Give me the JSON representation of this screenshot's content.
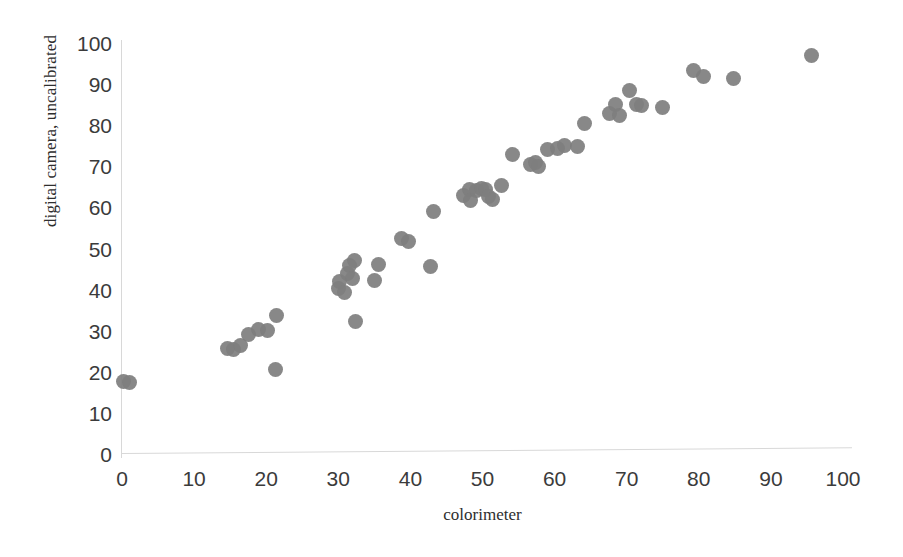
{
  "chart_data": {
    "type": "scatter",
    "title": "",
    "xlabel": "colorimeter",
    "ylabel": "digital camera, uncalibrated",
    "xlim": [
      0,
      100
    ],
    "ylim": [
      0,
      100
    ],
    "xticks": [
      0,
      10,
      20,
      30,
      40,
      50,
      60,
      70,
      80,
      90,
      100
    ],
    "yticks": [
      0,
      10,
      20,
      30,
      40,
      50,
      60,
      70,
      80,
      90,
      100
    ],
    "grid": false,
    "legend": null,
    "marker": {
      "shape": "circle",
      "color": "#7e7e7e",
      "size_px": 15
    },
    "series": [
      {
        "name": "measurements",
        "n_points": 56,
        "points": [
          [
            0.2,
            18.0
          ],
          [
            1.0,
            17.6
          ],
          [
            14.6,
            26.0
          ],
          [
            15.4,
            25.6
          ],
          [
            16.4,
            26.6
          ],
          [
            17.6,
            29.3
          ],
          [
            19.0,
            30.5
          ],
          [
            20.2,
            30.2
          ],
          [
            21.4,
            34.0
          ],
          [
            21.3,
            20.9
          ],
          [
            30.0,
            40.5
          ],
          [
            30.2,
            42.2
          ],
          [
            30.8,
            39.5
          ],
          [
            31.3,
            44.2
          ],
          [
            31.6,
            46.0
          ],
          [
            32.0,
            43.0
          ],
          [
            32.2,
            47.4
          ],
          [
            32.4,
            32.6
          ],
          [
            35.0,
            42.4
          ],
          [
            35.6,
            46.4
          ],
          [
            38.8,
            52.6
          ],
          [
            39.8,
            51.9
          ],
          [
            42.8,
            45.9
          ],
          [
            43.2,
            59.2
          ],
          [
            47.4,
            63.1
          ],
          [
            48.2,
            64.6
          ],
          [
            48.3,
            62.0
          ],
          [
            49.2,
            64.3
          ],
          [
            49.8,
            64.9
          ],
          [
            50.4,
            64.6
          ],
          [
            50.8,
            63.0
          ],
          [
            51.4,
            62.1
          ],
          [
            52.6,
            65.6
          ],
          [
            54.2,
            73.2
          ],
          [
            56.6,
            70.6
          ],
          [
            57.4,
            71.2
          ],
          [
            57.8,
            70.2
          ],
          [
            59.0,
            74.4
          ],
          [
            60.4,
            74.6
          ],
          [
            61.4,
            75.2
          ],
          [
            63.2,
            75.0
          ],
          [
            64.2,
            80.7
          ],
          [
            67.6,
            83.0
          ],
          [
            68.4,
            85.2
          ],
          [
            69.0,
            82.6
          ],
          [
            70.4,
            88.8
          ],
          [
            71.4,
            85.3
          ],
          [
            72.0,
            85.0
          ],
          [
            75.0,
            84.5
          ],
          [
            79.2,
            93.5
          ],
          [
            80.6,
            92.2
          ],
          [
            84.8,
            91.7
          ],
          [
            95.6,
            97.3
          ]
        ]
      }
    ]
  },
  "axis": {
    "y_title": "digital camera, uncalibrated",
    "x_title": "colorimeter",
    "y_tick_labels": [
      "100",
      "90",
      "80",
      "70",
      "60",
      "50",
      "40",
      "30",
      "20",
      "10",
      "0"
    ],
    "x_tick_labels": [
      "0",
      "10",
      "20",
      "30",
      "40",
      "50",
      "60",
      "70",
      "80",
      "90",
      "100"
    ]
  },
  "colors": {
    "marker": "#7e7e7e",
    "axis_line": "#d8d8d8",
    "tick_text": "#3b3b3b",
    "title_text": "#2e2e2e",
    "background": "#ffffff"
  }
}
